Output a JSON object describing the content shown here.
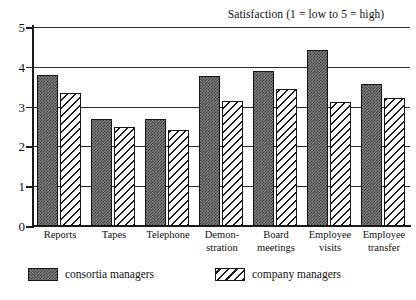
{
  "chart_data": {
    "type": "bar",
    "title": "Satisfaction (1 = low to 5 = high)",
    "xlabel": "",
    "ylabel": "",
    "ylim": [
      0,
      5
    ],
    "yticks": [
      0,
      1,
      2,
      3,
      4,
      5
    ],
    "ytick_labels": [
      "0",
      "1",
      "2",
      "3",
      "4",
      "5"
    ],
    "grid": true,
    "grid_axis": "y",
    "legend_position": "bottom",
    "categories": [
      "Reports",
      "Tapes",
      "Telephone",
      "Demon-stration",
      "Board meetings",
      "Employee visits",
      "Employee transfer"
    ],
    "category_lines": [
      [
        "Reports",
        ""
      ],
      [
        "Tapes",
        ""
      ],
      [
        "Telephone",
        ""
      ],
      [
        "Demon-",
        "stration"
      ],
      [
        "Board",
        "meetings"
      ],
      [
        "Employee",
        "visits"
      ],
      [
        "Employee",
        "transfer"
      ]
    ],
    "series": [
      {
        "name": "consortia managers",
        "fill": "stipple-dark-gray",
        "color": "#7e7e7e",
        "values": [
          3.8,
          2.7,
          2.7,
          3.78,
          3.9,
          4.42,
          3.58
        ]
      },
      {
        "name": "company managers",
        "fill": "diagonal-hatch-white",
        "color": "#ffffff",
        "values": [
          3.35,
          2.5,
          2.42,
          3.14,
          3.44,
          3.12,
          3.22
        ]
      }
    ]
  },
  "legend": {
    "items": [
      {
        "label": "consortia managers"
      },
      {
        "label": "company managers"
      }
    ]
  }
}
